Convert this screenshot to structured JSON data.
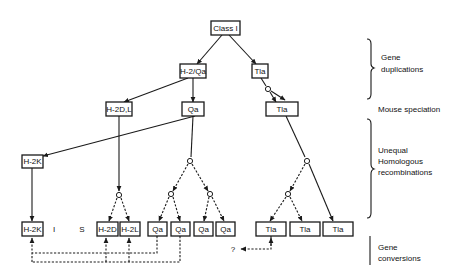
{
  "diagram": {
    "nodes": {
      "class1": "Class I",
      "h2qa": "H-2/Qa",
      "tla_top": "Tla",
      "h2dl": "H-2D,L",
      "qa_mid": "Qa",
      "tla_mid": "Tla",
      "h2k_mid": "H-2K",
      "h2k_bottom": "H-2K",
      "i_region": "I",
      "s_region": "S",
      "h2d_bottom": "H-2D",
      "h2l_bottom": "H-2L",
      "qa_bottom_1": "Qa",
      "qa_bottom_2": "Qa",
      "qa_bottom_3": "Qa",
      "qa_bottom_4": "Qa",
      "tla_bottom_1": "Tla",
      "tla_bottom_2": "Tla",
      "tla_bottom_3": "Tla",
      "unknown_target": "?"
    },
    "stages": {
      "gene_duplications": [
        "Gene",
        "duplications"
      ],
      "mouse_speciation": "Mouse speciation",
      "unequal_recombinations": [
        "Unequal",
        "Homologous",
        "recombinations"
      ],
      "gene_conversions": [
        "Gene",
        "conversions"
      ]
    }
  }
}
